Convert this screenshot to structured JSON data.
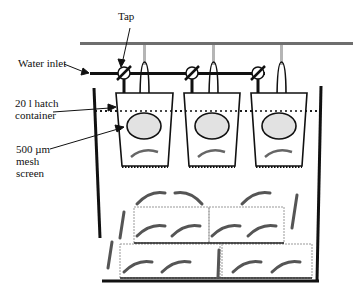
{
  "diagram": {
    "type": "aquaculture hatchery setup",
    "labels": {
      "tap": "Tap",
      "water_inlet": "Water inlet",
      "hatch_container_line1": "20 l hatch",
      "hatch_container_line2": "container",
      "mesh_line1": "500 µm",
      "mesh_line2": "mesh",
      "mesh_line3": "screen"
    },
    "components": [
      "overhead air pipe",
      "water inlet pipe",
      "3 taps",
      "3 hatch containers",
      "mesh screens",
      "large holding tank",
      "shrimp on shelters"
    ],
    "hatch_container_count": 3,
    "colors": {
      "line": "#111111",
      "air_pipe": "#6e6e6e",
      "air_drop": "#b5b5b5",
      "mesh_fill": "#e2e2e2"
    }
  }
}
